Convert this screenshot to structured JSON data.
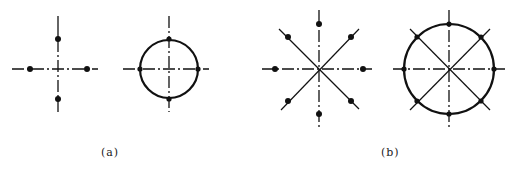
{
  "figures": [
    {
      "label": "(a)",
      "panels": [
        {
          "name": "four-points-cross",
          "type": "cross",
          "points": 4,
          "ring": false
        },
        {
          "name": "four-points-circle",
          "type": "circle",
          "points": 4,
          "ring": true
        }
      ]
    },
    {
      "label": "(b)",
      "panels": [
        {
          "name": "eight-points-star",
          "type": "star",
          "points": 8,
          "ring": false
        },
        {
          "name": "eight-points-circle",
          "type": "circle",
          "points": 8,
          "ring": true
        }
      ]
    }
  ],
  "colors": {
    "line": "#111111",
    "background": "#ffffff"
  }
}
